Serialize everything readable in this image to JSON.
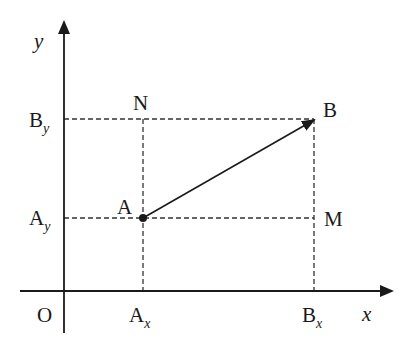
{
  "diagram": {
    "type": "vector-components-on-cartesian-plane",
    "colors": {
      "background": "#ffffff",
      "ink": "#1a1a1a",
      "dashed": "#333333"
    },
    "axes": {
      "origin_label": "O",
      "x_label": "x",
      "y_label": "y"
    },
    "points": {
      "A": {
        "label": "A",
        "x_label_main": "A",
        "x_label_sub": "x",
        "y_label_main": "A",
        "y_label_sub": "y"
      },
      "B": {
        "label": "B",
        "x_label_main": "B",
        "x_label_sub": "x",
        "y_label_main": "B",
        "y_label_sub": "y"
      },
      "N": {
        "label": "N"
      },
      "M": {
        "label": "M"
      }
    },
    "vector": {
      "from": "A",
      "to": "B"
    }
  }
}
